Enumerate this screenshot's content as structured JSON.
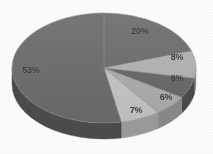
{
  "chart_data": {
    "type": "pie",
    "title": "",
    "subtitle": "",
    "xlabel": "",
    "ylabel": "",
    "three_d": true,
    "legend": "none",
    "grid": false,
    "labels_format": "percent",
    "categories": [
      "Segment 1",
      "Segment 2",
      "Segment 3",
      "Segment 4",
      "Segment 5",
      "Segment 6"
    ],
    "values": [
      20,
      8,
      6,
      6,
      7,
      53
    ],
    "value_labels": [
      "20%",
      "8%",
      "6%",
      "6%",
      "7%",
      "53%"
    ],
    "colors": [
      "#6f6f6f",
      "#b6b6b6",
      "#6a6a6a",
      "#b0b0b0",
      "#c9c9c9",
      "#6e6e6e"
    ],
    "slices": [
      {
        "label": "20%",
        "value": 20,
        "color": "#6f6f6f",
        "side_color": "#4d4d4d",
        "start_angle": 0,
        "end_angle": 72,
        "label_x": 140,
        "label_y": 31
      },
      {
        "label": "8%",
        "value": 8,
        "color": "#b6b6b6",
        "side_color": "#8d8d8d",
        "start_angle": 72,
        "end_angle": 100.8,
        "label_x": 177,
        "label_y": 57
      },
      {
        "label": "6%",
        "value": 6,
        "color": "#6a6a6a",
        "side_color": "#4a4a4a",
        "start_angle": 100.8,
        "end_angle": 122.4,
        "label_x": 177,
        "label_y": 78
      },
      {
        "label": "6%",
        "value": 6,
        "color": "#b0b0b0",
        "side_color": "#898989",
        "start_angle": 122.4,
        "end_angle": 144,
        "label_x": 166,
        "label_y": 97
      },
      {
        "label": "7%",
        "value": 7,
        "color": "#c9c9c9",
        "side_color": "#9b9b9b",
        "start_angle": 144,
        "end_angle": 169.2,
        "label_x": 136,
        "label_y": 110
      },
      {
        "label": "53%",
        "value": 53,
        "color": "#6e6e6e",
        "side_color": "#4c4c4c",
        "start_angle": 169.2,
        "end_angle": 360,
        "label_x": 31,
        "label_y": 70
      }
    ],
    "geometry": {
      "center_x": 104,
      "center_y": 68,
      "radius_x": 92,
      "radius_y": 55,
      "depth": 16
    },
    "background_color": "#fdfdfd",
    "label_color": "#3a3a3a"
  }
}
